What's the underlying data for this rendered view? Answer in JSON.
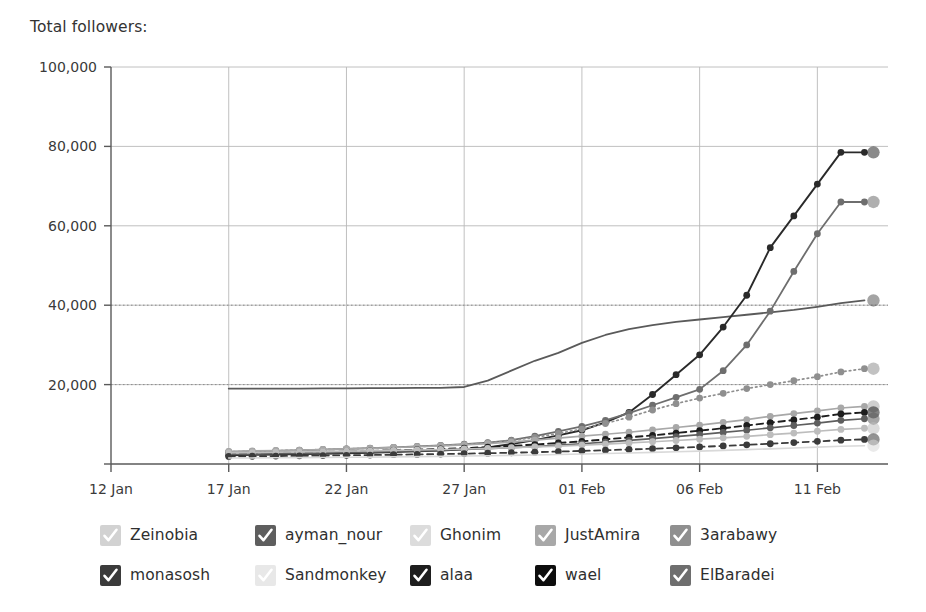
{
  "header": {
    "title": "Total followers:"
  },
  "legend": {
    "position": "bottom",
    "items": [
      {
        "label": "Zeinobia",
        "color": "#d2d2d2",
        "check": "#ffffff"
      },
      {
        "label": "ayman_nour",
        "color": "#5e5e5e",
        "check": "#ffffff"
      },
      {
        "label": "Ghonim",
        "color": "#dcdcdc",
        "check": "#ffffff"
      },
      {
        "label": "JustAmira",
        "color": "#a8a8a8",
        "check": "#ffffff"
      },
      {
        "label": "3arabawy",
        "color": "#8f8f8f",
        "check": "#ffffff"
      },
      {
        "label": "monasosh",
        "color": "#3b3b3b",
        "check": "#ffffff"
      },
      {
        "label": "Sandmonkey",
        "color": "#e8e8e8",
        "check": "#ffffff"
      },
      {
        "label": "alaa",
        "color": "#1e1e1e",
        "check": "#ffffff"
      },
      {
        "label": "wael",
        "color": "#0d0d0d",
        "check": "#ffffff"
      },
      {
        "label": "ElBaradei",
        "color": "#6e6e6e",
        "check": "#ffffff"
      }
    ]
  },
  "chart_data": {
    "type": "line",
    "title": "Total followers:",
    "xlabel": "",
    "ylabel": "",
    "grid": true,
    "legend_position": "bottom",
    "ylim": [
      0,
      100000
    ],
    "yticks": [
      0,
      20000,
      40000,
      60000,
      80000,
      100000
    ],
    "ytick_labels": [
      "0",
      "20,000",
      "40,000",
      "60,000",
      "80,000",
      "100,000"
    ],
    "xticks": [
      "12 Jan",
      "17 Jan",
      "22 Jan",
      "27 Jan",
      "01 Feb",
      "06 Feb",
      "11 Feb"
    ],
    "xtick_days": [
      12,
      17,
      22,
      27,
      32,
      37,
      42
    ],
    "xlim_days": [
      12,
      45
    ],
    "x": [
      17,
      18,
      19,
      20,
      21,
      22,
      23,
      24,
      25,
      26,
      27,
      28,
      29,
      30,
      31,
      32,
      33,
      34,
      35,
      36,
      37,
      38,
      39,
      40,
      41,
      42,
      43,
      44
    ],
    "series": [
      {
        "name": "Ghonim",
        "color": "#5a5a5a",
        "style": "solid",
        "width": 1.8,
        "markers": false,
        "values": [
          19000,
          19000,
          19000,
          19000,
          19050,
          19050,
          19100,
          19100,
          19150,
          19200,
          19400,
          21000,
          23500,
          26000,
          28000,
          30500,
          32500,
          34000,
          35000,
          35800,
          36400,
          37000,
          37600,
          38200,
          38800,
          39600,
          40500,
          41200
        ]
      },
      {
        "name": "wael",
        "color": "#2a2a2a",
        "style": "solid",
        "width": 1.9,
        "markers": true,
        "values": [
          2200,
          2300,
          2400,
          2500,
          2600,
          2700,
          2850,
          3000,
          3200,
          3400,
          3700,
          4200,
          5000,
          6000,
          7200,
          8500,
          10500,
          13000,
          17500,
          22500,
          27500,
          34500,
          42500,
          54500,
          62500,
          70500,
          78500,
          78500
        ]
      },
      {
        "name": "ElBaradei",
        "color": "#6e6e6e",
        "style": "solid",
        "width": 1.8,
        "markers": true,
        "values": [
          3000,
          3150,
          3300,
          3450,
          3600,
          3800,
          4000,
          4200,
          4450,
          4700,
          5000,
          5400,
          6000,
          7000,
          8200,
          9500,
          11000,
          12800,
          14800,
          16800,
          18800,
          23500,
          30000,
          38500,
          48500,
          58000,
          66000,
          66000
        ]
      },
      {
        "name": "3arabawy",
        "color": "#8f8f8f",
        "style": "dotted",
        "width": 1.7,
        "markers": true,
        "values": [
          3100,
          3200,
          3350,
          3500,
          3650,
          3800,
          3950,
          4150,
          4350,
          4600,
          4900,
          5300,
          5900,
          6700,
          7700,
          8800,
          10200,
          11800,
          13600,
          15200,
          16600,
          17800,
          19000,
          20000,
          21000,
          22000,
          23200,
          24000
        ]
      },
      {
        "name": "JustAmira",
        "color": "#a8a8a8",
        "style": "solid",
        "width": 1.7,
        "markers": true,
        "values": [
          3200,
          3300,
          3400,
          3500,
          3650,
          3800,
          3950,
          4150,
          4350,
          4550,
          4800,
          5100,
          5500,
          6000,
          6500,
          7000,
          7500,
          8000,
          8600,
          9200,
          9800,
          10500,
          11200,
          12000,
          12700,
          13400,
          14100,
          14500
        ]
      },
      {
        "name": "alaa",
        "color": "#1e1e1e",
        "style": "dashed",
        "width": 1.9,
        "markers": true,
        "values": [
          2600,
          2700,
          2800,
          2900,
          3000,
          3150,
          3300,
          3450,
          3600,
          3800,
          4000,
          4250,
          4550,
          4900,
          5300,
          5700,
          6200,
          6700,
          7200,
          7800,
          8400,
          9000,
          9700,
          10400,
          11100,
          11800,
          12600,
          13000
        ]
      },
      {
        "name": "ayman_nour",
        "color": "#5e5e5e",
        "style": "solid",
        "width": 1.7,
        "markers": true,
        "values": [
          2400,
          2500,
          2600,
          2700,
          2800,
          2900,
          3000,
          3150,
          3300,
          3450,
          3650,
          3850,
          4100,
          4400,
          4750,
          5100,
          5500,
          5950,
          6400,
          6900,
          7400,
          7950,
          8500,
          9100,
          9700,
          10300,
          11000,
          11400
        ]
      },
      {
        "name": "Zeinobia",
        "color": "#bdbdbd",
        "style": "solid",
        "width": 1.7,
        "markers": true,
        "values": [
          2800,
          2880,
          2960,
          3040,
          3130,
          3220,
          3320,
          3420,
          3530,
          3650,
          3780,
          3930,
          4100,
          4300,
          4520,
          4760,
          5020,
          5300,
          5600,
          5920,
          6250,
          6600,
          6980,
          7380,
          7800,
          8250,
          8700,
          9000
        ]
      },
      {
        "name": "monasosh",
        "color": "#3b3b3b",
        "style": "dashed",
        "width": 1.8,
        "markers": true,
        "values": [
          1900,
          1950,
          2000,
          2060,
          2120,
          2190,
          2260,
          2340,
          2420,
          2510,
          2610,
          2720,
          2840,
          2980,
          3130,
          3290,
          3470,
          3660,
          3860,
          4080,
          4310,
          4560,
          4820,
          5100,
          5400,
          5700,
          6000,
          6200
        ]
      },
      {
        "name": "Sandmonkey",
        "color": "#d9d9d9",
        "style": "solid",
        "width": 1.6,
        "markers": false,
        "values": [
          1500,
          1530,
          1560,
          1600,
          1640,
          1690,
          1740,
          1800,
          1860,
          1930,
          2000,
          2080,
          2170,
          2270,
          2380,
          2500,
          2630,
          2770,
          2920,
          3080,
          3250,
          3430,
          3620,
          3820,
          4030,
          4250,
          4480,
          4600
        ]
      }
    ],
    "reference_lines": [
      {
        "y": 40000,
        "style": "dotted",
        "color": "#8a8a8a"
      },
      {
        "y": 20000,
        "style": "dotted",
        "color": "#8a8a8a"
      }
    ]
  }
}
